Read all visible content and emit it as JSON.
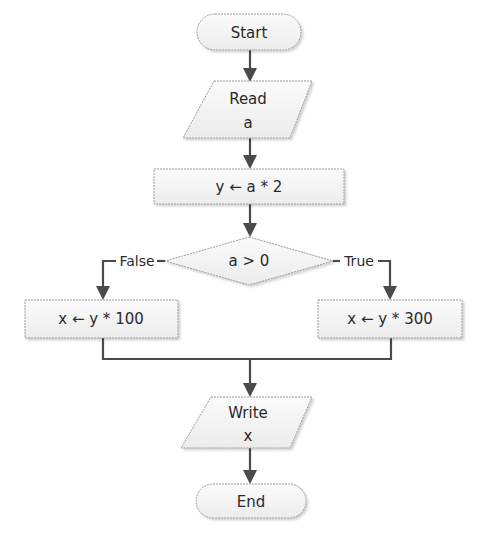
{
  "flowchart": {
    "nodes": {
      "start": {
        "type": "terminal",
        "label": "Start"
      },
      "read": {
        "type": "input",
        "line1": "Read",
        "line2": "a"
      },
      "assign_y": {
        "type": "process",
        "label": "y ← a * 2"
      },
      "decision": {
        "type": "decision",
        "label": "a > 0"
      },
      "false_branch": {
        "type": "process",
        "label": "x ← y * 100"
      },
      "true_branch": {
        "type": "process",
        "label": "x ← y * 300"
      },
      "write": {
        "type": "output",
        "line1": "Write",
        "line2": "x"
      },
      "end": {
        "type": "terminal",
        "label": "End"
      }
    },
    "edges": {
      "false_label": "False",
      "true_label": "True"
    },
    "colors": {
      "shape_fill": "#f2f2f2",
      "shape_border": "#9a9a9a",
      "connector": "#4a4a4a",
      "text": "#2a2a2a"
    }
  }
}
